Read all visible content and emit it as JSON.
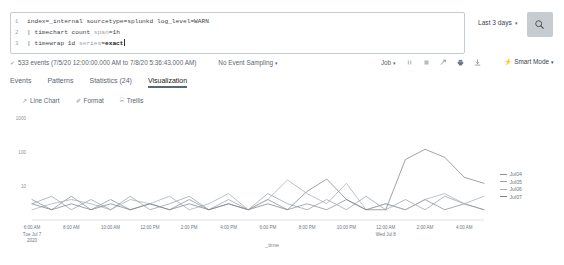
{
  "search": {
    "query_lines": [
      {
        "num": "1",
        "parts": [
          {
            "t": "index=_internal sourcetype=splunkd log_level=WARN",
            "c": "kw"
          }
        ]
      },
      {
        "num": "2",
        "parts": [
          {
            "t": "| timechart count ",
            "c": "kw"
          },
          {
            "t": "span",
            "c": "arg"
          },
          {
            "t": "=1h",
            "c": "kw"
          }
        ]
      },
      {
        "num": "3",
        "parts": [
          {
            "t": "| timewrap 1d ",
            "c": "kw"
          },
          {
            "t": "series",
            "c": "arg"
          },
          {
            "t": "=",
            "c": "kw"
          },
          {
            "t": "exact",
            "c": "val"
          }
        ]
      }
    ],
    "line1_num": "1",
    "line2_num": "2",
    "line3_num": "3",
    "line1_text": "index=_internal sourcetype=splunkd log_level=WARN",
    "line2_pre": "| timechart count ",
    "line2_arg": "span",
    "line2_post": "=1h",
    "line3_pre": "| timewrap 1d ",
    "line3_arg": "series",
    "line3_eq": "=",
    "line3_val": "exact",
    "time_range_label": "Last 3 days",
    "time_range_chevron": "▾",
    "search_icon": "search-icon"
  },
  "status": {
    "check_icon": "✓",
    "events_text": "533 events (7/5/20 12:00:00.000 AM to 7/8/20 5:36:43.000 AM)",
    "sampling_label": "No Event Sampling",
    "sampling_chevron": "▾",
    "job_label": "Job",
    "job_chevron": "▾",
    "icons": [
      "pause-icon",
      "stop-icon",
      "share-icon",
      "print-icon",
      "export-icon"
    ],
    "smart_mode_bolt": "⚡",
    "smart_mode_label": "Smart Mode",
    "smart_mode_chevron": "▾"
  },
  "tabs": [
    {
      "label": "Events",
      "active": false
    },
    {
      "label": "Patterns",
      "active": false
    },
    {
      "label": "Statistics (24)",
      "active": false
    },
    {
      "label": "Visualization",
      "active": true
    }
  ],
  "chart_controls": [
    {
      "icon": "↗",
      "label": "Line Chart"
    },
    {
      "icon": "✐",
      "label": "Format"
    },
    {
      "icon": "⌸",
      "label": "Trellis"
    }
  ],
  "chart_data": {
    "type": "line",
    "title": "",
    "xlabel": "_time",
    "ylabel": "",
    "yscale": "log",
    "ylim": [
      1,
      1000
    ],
    "ytick_labels": [
      "1000",
      "100",
      "10"
    ],
    "grid": false,
    "legend_position": "right",
    "xtick_labels": [
      "6:00 AM",
      "8:00 AM",
      "10:00 AM",
      "12:00 PM",
      "2:00 PM",
      "4:00 PM",
      "6:00 PM",
      "8:00 PM",
      "10:00 PM",
      "12:00 AM",
      "2:00 AM",
      "4:00 AM"
    ],
    "xtick_sublabels": [
      "Tue Jul 7\n2020",
      "",
      "",
      "",
      "",
      "",
      "",
      "",
      "",
      "Wed Jul 8",
      "",
      ""
    ],
    "xtick_sub_first_line1": "Tue Jul 7",
    "xtick_sub_first_line2": "2020",
    "xtick_sub_mid": "Wed Jul 8",
    "x": [
      0,
      1,
      2,
      3,
      4,
      5,
      6,
      7,
      8,
      9,
      10,
      11,
      12,
      13,
      14,
      15,
      16,
      17,
      18,
      19,
      20,
      21,
      22,
      23
    ],
    "series": [
      {
        "name": "Jul04",
        "color": "#8a8f98",
        "values": [
          4,
          2,
          5,
          2,
          4,
          2,
          3,
          2,
          4,
          2,
          3,
          2,
          4,
          2,
          3,
          2,
          4,
          2,
          3,
          2,
          4,
          2,
          3,
          2
        ]
      },
      {
        "name": "Jul05",
        "color": "#9aa0a8",
        "values": [
          3,
          5,
          2,
          4,
          2,
          5,
          2,
          3,
          5,
          2,
          4,
          2,
          6,
          3,
          2,
          4,
          2,
          5,
          2,
          4,
          2,
          5,
          3,
          2
        ]
      },
      {
        "name": "Jul06",
        "color": "#a8aeb6",
        "values": [
          2,
          3,
          4,
          3,
          2,
          4,
          3,
          5,
          2,
          3,
          6,
          2,
          4,
          15,
          6,
          3,
          12,
          2,
          3,
          2,
          4,
          6,
          3,
          5
        ]
      },
      {
        "name": "Jul07",
        "color": "#7e848d",
        "values": [
          3,
          2,
          3,
          2,
          3,
          2,
          3,
          2,
          3,
          2,
          3,
          2,
          3,
          2,
          7,
          16,
          4,
          2,
          2,
          60,
          120,
          70,
          18,
          12
        ]
      }
    ]
  },
  "legend": [
    {
      "label": "Jul04",
      "color": "#8a8f98"
    },
    {
      "label": "Jul05",
      "color": "#9aa0a8"
    },
    {
      "label": "Jul06",
      "color": "#a8aeb6"
    },
    {
      "label": "Jul07",
      "color": "#7e848d"
    }
  ]
}
